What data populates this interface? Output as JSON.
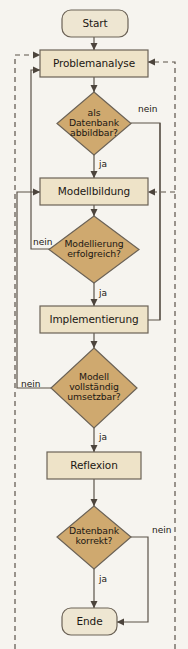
{
  "diagram": {
    "type": "flowchart",
    "language": "de",
    "background_color": "#f6f4ef",
    "colors": {
      "terminator_fill": "#eee6d2",
      "process_fill": "#eee3c8",
      "decision_fill": "#cfa96f",
      "stroke": "#6b6256",
      "line": "#5b5249",
      "text": "#1c1713",
      "dashed_line": "#6b6256"
    },
    "nodes": [
      {
        "id": "start",
        "shape": "terminator",
        "label": "Start"
      },
      {
        "id": "problemanalyse",
        "shape": "process",
        "label": "Problemanalyse"
      },
      {
        "id": "d_datenbank",
        "shape": "decision",
        "label": "als\nDatenbank\nabbildbar?"
      },
      {
        "id": "modellbildung",
        "shape": "process",
        "label": "Modellbildung"
      },
      {
        "id": "d_modellierung",
        "shape": "decision",
        "label": "Modellierung\nerfolgreich?"
      },
      {
        "id": "implementierung",
        "shape": "process",
        "label": "Implementierung"
      },
      {
        "id": "d_modell",
        "shape": "decision",
        "label": "Modell\nvollständig\numsetzbar?"
      },
      {
        "id": "reflexion",
        "shape": "process",
        "label": "Reflexion"
      },
      {
        "id": "d_korrekt",
        "shape": "decision",
        "label": "Datenbank\nkorrekt?"
      },
      {
        "id": "ende",
        "shape": "terminator",
        "label": "Ende"
      }
    ],
    "edge_labels": [
      {
        "id": "lbl-datenbank-nein",
        "text": "nein",
        "for": "d_datenbank"
      },
      {
        "id": "lbl-datenbank-ja",
        "text": "ja",
        "for": "d_datenbank"
      },
      {
        "id": "lbl-modellierung-nein",
        "text": "nein",
        "for": "d_modellierung"
      },
      {
        "id": "lbl-modellierung-ja",
        "text": "ja",
        "for": "d_modellierung"
      },
      {
        "id": "lbl-modell-nein",
        "text": "nein",
        "for": "d_modell"
      },
      {
        "id": "lbl-modell-ja",
        "text": "ja",
        "for": "d_modell"
      },
      {
        "id": "lbl-korrekt-nein",
        "text": "nein",
        "for": "d_korrekt"
      },
      {
        "id": "lbl-korrekt-ja",
        "text": "ja",
        "for": "d_korrekt"
      }
    ]
  }
}
